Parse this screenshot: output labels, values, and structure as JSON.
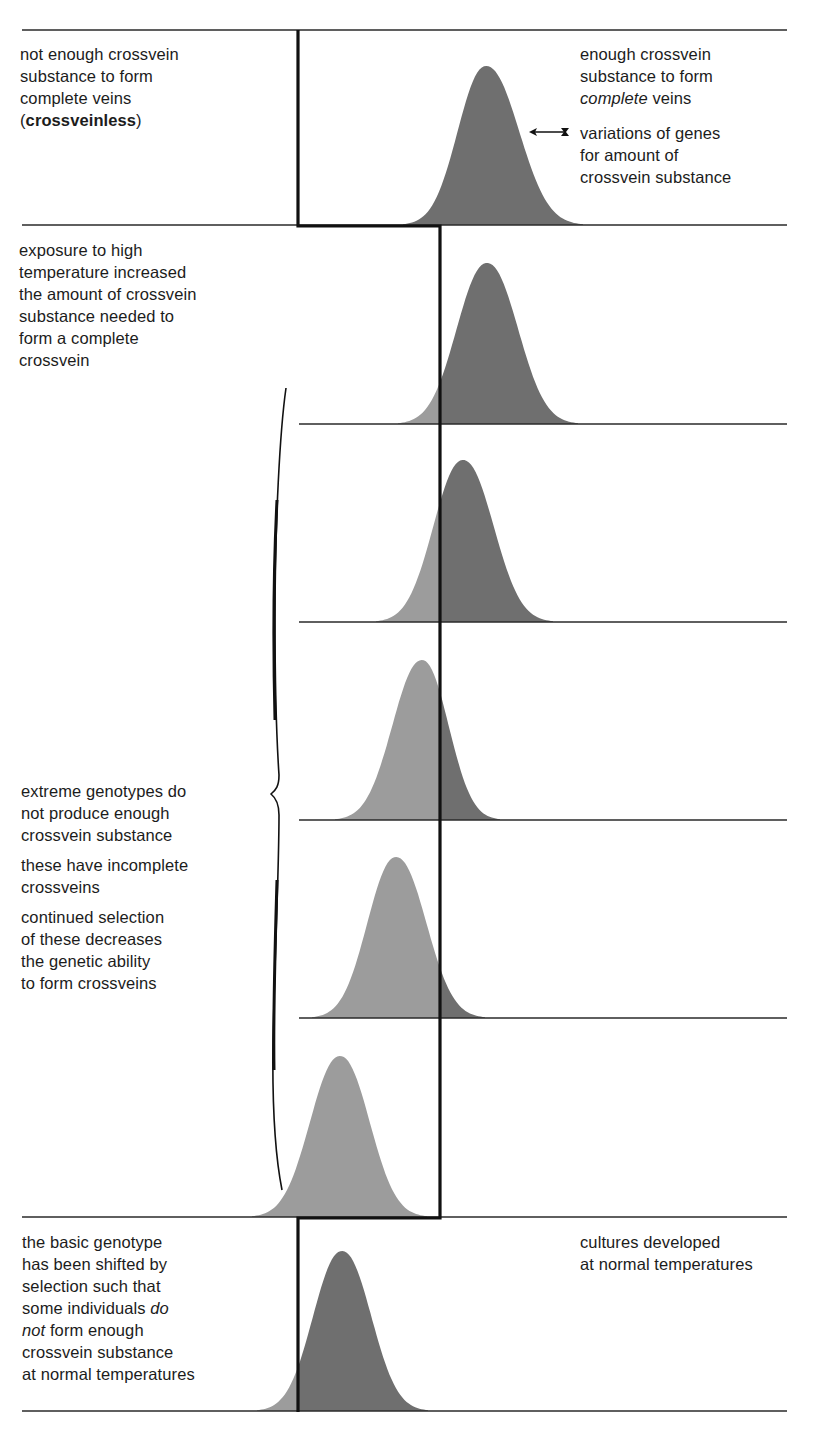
{
  "colors": {
    "background": "#ffffff",
    "rule_line": "#2a2a2a",
    "threshold_line": "#111111",
    "curve_below_threshold": "#9c9c9c",
    "curve_above_threshold": "#6f6f6f",
    "text": "#1c1c1c"
  },
  "labels": {
    "top_left": {
      "line1": "not enough crossvein",
      "line2": "substance to form",
      "line3": "complete veins",
      "line4_open": "(",
      "line4_bold": "crossveinless",
      "line4_close": ")"
    },
    "top_right": {
      "line1": "enough crossvein",
      "line2": "substance to form",
      "line3_italic": "complete",
      "line3_rest": " veins"
    },
    "arrow_note": {
      "line1": "variations of genes",
      "line2": "for amount of",
      "line3": "crossvein substance"
    },
    "high_temp": {
      "line1": "exposure to high",
      "line2": "temperature increased",
      "line3": "the amount of crossvein",
      "line4": "substance needed to",
      "line5": "form a complete",
      "line6": "crossvein"
    },
    "selection": {
      "para1": [
        "extreme genotypes do",
        "not produce enough",
        "crossvein substance"
      ],
      "para2": [
        "these have incomplete",
        "crossveins"
      ],
      "para3": [
        "continued selection",
        "of these decreases",
        "the genetic ability",
        "to form crossveins"
      ]
    },
    "bottom_left": {
      "line1": "the basic genotype",
      "line2": "has been shifted by",
      "line3": "selection such that",
      "line4_pre": "some individuals ",
      "line4_italic": "do",
      "line5_italic": "not",
      "line5_rest": " form enough",
      "line6": "crossvein substance",
      "line7": "at normal temperatures"
    },
    "bottom_right": {
      "line1": "cultures developed",
      "line2": "at normal temperatures"
    }
  },
  "panels": [
    {
      "name": "normal-temperature-start",
      "top": 30,
      "base": 225,
      "line_x1": 22,
      "peak_x": 486,
      "peak_y": 66,
      "left_x": 403,
      "right_x": 583,
      "threshold_x": 298
    },
    {
      "name": "high-temperature-gen-1",
      "top": 226,
      "base": 424,
      "line_x1": 299,
      "peak_x": 487,
      "peak_y": 263,
      "left_x": 398,
      "right_x": 578,
      "threshold_x": 440
    },
    {
      "name": "high-temperature-gen-2",
      "top": 424,
      "base": 622,
      "line_x1": 299,
      "peak_x": 463,
      "peak_y": 460,
      "left_x": 376,
      "right_x": 553,
      "threshold_x": 440
    },
    {
      "name": "high-temperature-gen-3",
      "top": 622,
      "base": 820,
      "line_x1": 299,
      "peak_x": 422,
      "peak_y": 660,
      "left_x": 335,
      "right_x": 500,
      "threshold_x": 440
    },
    {
      "name": "high-temperature-gen-4",
      "top": 820,
      "base": 1018,
      "line_x1": 299,
      "peak_x": 396,
      "peak_y": 857,
      "left_x": 312,
      "right_x": 485,
      "threshold_x": 440
    },
    {
      "name": "high-temperature-gen-5",
      "top": 1018,
      "base": 1217,
      "line_x1": 22,
      "peak_x": 340,
      "peak_y": 1056,
      "left_x": 252,
      "right_x": 427,
      "threshold_x": 440
    },
    {
      "name": "normal-temperature-end",
      "top": 1217,
      "base": 1411,
      "line_x1": 22,
      "peak_x": 342,
      "peak_y": 1251,
      "left_x": 257,
      "right_x": 428,
      "threshold_x": 298
    }
  ],
  "threshold": {
    "normal_x": 298,
    "high_temp_x": 440
  }
}
